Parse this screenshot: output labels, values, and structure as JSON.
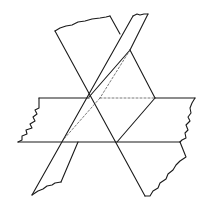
{
  "diagram": {
    "title": "Three intersecting planes",
    "colors": {
      "stroke": "#1a1a1a",
      "hidden_stroke": "#555555",
      "background": "#ffffff"
    },
    "planes": [
      {
        "name": "horizontal-plane",
        "label": "horizontal plane"
      },
      {
        "name": "tilted-plane-a",
        "label": "tilted plane A"
      },
      {
        "name": "tilted-plane-b",
        "label": "tilted plane B"
      }
    ]
  }
}
